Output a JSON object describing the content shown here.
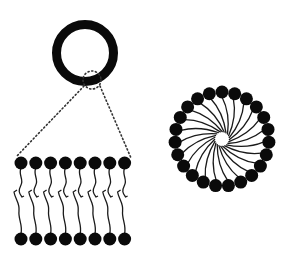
{
  "canvas": {
    "width": 288,
    "height": 253,
    "background": "#ffffff"
  },
  "colors": {
    "ink": "#0a0a0a",
    "tail": "#1a1a1a",
    "dots": "#333333"
  },
  "vesicle": {
    "label": "",
    "cx": 85,
    "cy": 53,
    "outer_r": 33,
    "inner_r": 24
  },
  "zoom_callout": {
    "circle": {
      "cx": 92,
      "cy": 80,
      "r": 9
    },
    "left_line": {
      "x1": 84,
      "y1": 86,
      "x2": 16,
      "y2": 157
    },
    "right_line": {
      "x1": 100,
      "y1": 86,
      "x2": 131,
      "y2": 158
    }
  },
  "bilayer": {
    "count": 8,
    "x_start": 21,
    "x_step": 14.8,
    "top_head_y": 163,
    "bottom_head_y": 239,
    "head_r": 6.5
  },
  "micelle": {
    "cx": 222,
    "cy": 139,
    "head_ring_r": 47,
    "head_r": 6.5,
    "core_r": 7,
    "count": 23,
    "swirl": 0.9
  }
}
